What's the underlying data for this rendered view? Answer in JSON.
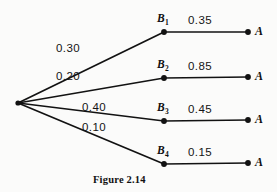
{
  "figure": {
    "caption": "Figure  2.14",
    "type": "probability-tree",
    "ink_color": "#121212",
    "background_color": "#fbfbfa"
  },
  "root": {
    "label": ""
  },
  "branches": [
    {
      "prior_probability": "0.30",
      "node_label": "B",
      "node_subscript": "1",
      "conditional_probability": "0.35",
      "terminal_label": "A"
    },
    {
      "prior_probability": "0.20",
      "node_label": "B",
      "node_subscript": "2",
      "conditional_probability": "0.85",
      "terminal_label": "A"
    },
    {
      "prior_probability": "0.40",
      "node_label": "B",
      "node_subscript": "3",
      "conditional_probability": "0.45",
      "terminal_label": "A"
    },
    {
      "prior_probability": "0.10",
      "node_label": "B",
      "node_subscript": "4",
      "conditional_probability": "0.15",
      "terminal_label": "A"
    }
  ]
}
